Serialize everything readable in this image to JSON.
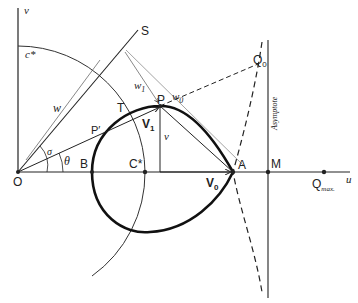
{
  "diagram": {
    "axes": {
      "horizontal": "u",
      "vertical": "v"
    },
    "points": {
      "origin": "O",
      "B": "B",
      "C_star": "C*",
      "A": "A",
      "M": "M",
      "P": "P",
      "P_prime": "P′",
      "T": "T",
      "S": "S",
      "Q0": "Q",
      "Q0_sub": "0",
      "Qmax": "Q",
      "Qmax_sub": "max."
    },
    "vectors": {
      "V0": "V",
      "V0_sub": "0",
      "V1": "V",
      "V1_sub": "1"
    },
    "lengths": {
      "w": "w",
      "w1": "w",
      "w1_sub": "1",
      "w0": "w",
      "w0_sub": "0",
      "v": "v"
    },
    "angles": {
      "sigma": "σ",
      "theta": "θ"
    },
    "arc_label": "c*",
    "asymptote_label": "Asymptote"
  }
}
